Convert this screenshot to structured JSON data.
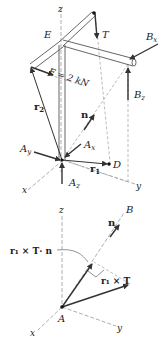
{
  "figure_top": {
    "labels": {
      "z": "z",
      "E": "E",
      "T": "T",
      "Bx": "B",
      "Bx_sub": "x",
      "Bz": "B",
      "Bz_sub": "z",
      "F": "F = 2 kN",
      "r2": "r",
      "r2_sub": "2",
      "n": "n",
      "Ay": "A",
      "Ay_sub": "y",
      "Ax": "A",
      "Ax_sub": "x",
      "Az": "A",
      "Az_sub": "z",
      "r1": "r",
      "r1_sub": "1",
      "D": "D",
      "x": "x",
      "y": "y"
    }
  },
  "figure_bottom": {
    "labels": {
      "z": "z",
      "B": "B",
      "n": "n",
      "r1xTn": "r₁ × T· n",
      "r1xT": "r₁ × T",
      "A": "A",
      "x": "x",
      "y": "y"
    }
  },
  "colors": {
    "line": "#333333",
    "axis": "#999999",
    "background": "#ffffff"
  }
}
